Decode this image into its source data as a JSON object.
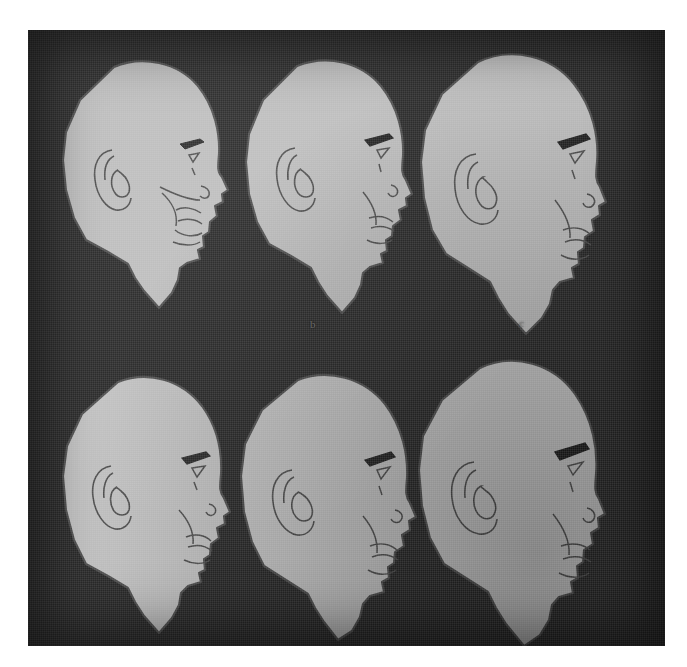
{
  "plate": {
    "title": "Six lateral head profile line drawings",
    "background_color": "#2a2a2a",
    "paper_color": "#ffffff",
    "head_fill_color": "#b8b8b8",
    "outline_color": "#4a4a4a",
    "rows": 2,
    "columns": 3,
    "total_figures": 6
  },
  "captions": [
    {
      "id": "cap-b",
      "label": "b",
      "x": 312,
      "y": 318
    },
    {
      "id": "cap-c",
      "label": "c",
      "x": 520,
      "y": 317
    }
  ],
  "figures": [
    {
      "id": "figure-1",
      "position": "top-left",
      "label": "a",
      "description": "Bald male head in right-facing profile, detailed face with eyebrow, eye, nose, nasolabial fold, lips and chin",
      "features": [
        "ear",
        "eyebrow",
        "eye",
        "nose",
        "nostril",
        "nasolabial-fold",
        "lips",
        "chin",
        "neck"
      ]
    },
    {
      "id": "figure-2",
      "position": "top-middle",
      "label": "b",
      "description": "Bald male head in right-facing profile with simplified face outline",
      "features": [
        "ear",
        "eyebrow",
        "eye",
        "nose",
        "nostril",
        "lips",
        "chin",
        "neck"
      ]
    },
    {
      "id": "figure-3",
      "position": "top-right",
      "label": "c",
      "description": "Bald male head in right-facing profile, larger cranium",
      "features": [
        "ear",
        "eyebrow",
        "eye",
        "nose",
        "nostril",
        "lips",
        "chin",
        "neck"
      ]
    },
    {
      "id": "figure-4",
      "position": "bottom-left",
      "label": "d",
      "description": "Bald male head in right-facing profile with sloped forehead",
      "features": [
        "ear",
        "eyebrow",
        "eye",
        "nose",
        "nostril",
        "lips",
        "chin",
        "neck"
      ]
    },
    {
      "id": "figure-5",
      "position": "bottom-middle",
      "label": "e",
      "description": "Bald male head in right-facing profile with rounded crown",
      "features": [
        "ear",
        "eyebrow",
        "eye",
        "nose",
        "nostril",
        "lips",
        "chin",
        "neck"
      ]
    },
    {
      "id": "figure-6",
      "position": "bottom-right",
      "label": "f",
      "description": "Bald male head in right-facing profile, tall cranium and long neck",
      "features": [
        "ear",
        "eyebrow",
        "eye",
        "nose",
        "nostril",
        "lips",
        "chin",
        "neck"
      ]
    }
  ]
}
